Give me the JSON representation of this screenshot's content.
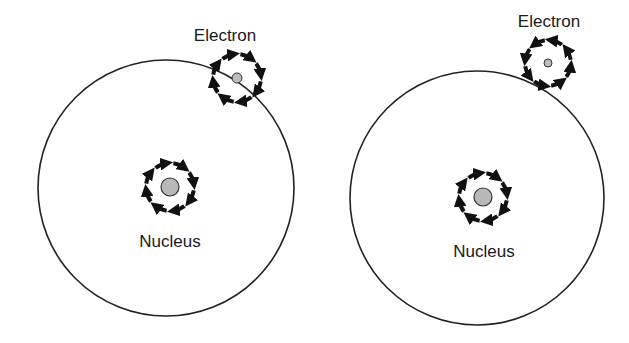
{
  "diagram": {
    "colors": {
      "line": "#222222",
      "nucleus_fill": "#b8b8b8",
      "electron_fill": "#bdbdbd",
      "arrow": "#111111"
    },
    "panels": [
      {
        "id": "left",
        "orbit": {
          "cx": 166,
          "cy": 188,
          "r": 128
        },
        "nucleus": {
          "cx": 170,
          "cy": 187,
          "r": 9,
          "spin_ring_r": 24,
          "spin_direction": "clockwise",
          "label": "Nucleus",
          "label_x": 170,
          "label_y": 247
        },
        "electron": {
          "cx": 237,
          "cy": 78,
          "r": 5,
          "spin_ring_r": 24,
          "spin_direction": "clockwise",
          "label": "Electron",
          "label_x": 225,
          "label_y": 41
        }
      },
      {
        "id": "right",
        "orbit": {
          "cx": 477,
          "cy": 198,
          "r": 127
        },
        "nucleus": {
          "cx": 483,
          "cy": 197,
          "r": 9,
          "spin_ring_r": 24,
          "spin_direction": "clockwise",
          "label": "Nucleus",
          "label_x": 484,
          "label_y": 257
        },
        "electron": {
          "cx": 548,
          "cy": 63,
          "r": 4,
          "spin_ring_r": 23,
          "spin_direction": "counterclockwise",
          "label": "Electron",
          "label_x": 549,
          "label_y": 27
        }
      }
    ]
  }
}
